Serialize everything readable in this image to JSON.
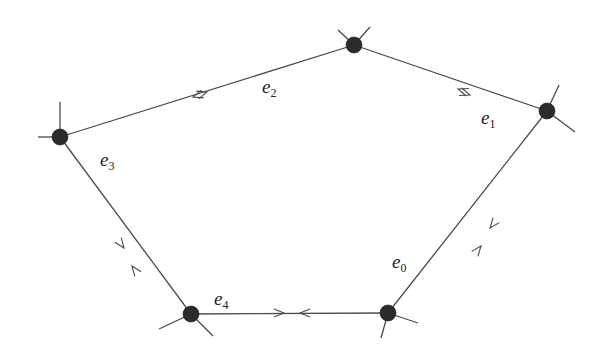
{
  "diagram": {
    "type": "pentagon-graph-with-directed-edge-pairs",
    "vertices": [
      {
        "id": "v_top",
        "x": 354,
        "y": 45,
        "stubs": [
          [
            -16,
            -15
          ],
          [
            16,
            -18
          ]
        ]
      },
      {
        "id": "v_right",
        "x": 547,
        "y": 111,
        "stubs": [
          [
            12,
            -26
          ],
          [
            28,
            21
          ]
        ]
      },
      {
        "id": "v_br",
        "x": 388,
        "y": 313,
        "stubs": [
          [
            30,
            10
          ],
          [
            -7,
            25
          ]
        ]
      },
      {
        "id": "v_bl",
        "x": 191,
        "y": 314,
        "stubs": [
          [
            -32,
            15
          ],
          [
            22,
            22
          ]
        ]
      },
      {
        "id": "v_left",
        "x": 60,
        "y": 137,
        "stubs": [
          [
            0,
            -35
          ],
          [
            -22,
            0
          ]
        ]
      }
    ],
    "edges": [
      {
        "name": "e0",
        "from": "v_br",
        "to": "v_right",
        "label_x": 392,
        "label_y": 268,
        "arrows": [
          {
            "x": 481,
            "y": 246,
            "dir": "to"
          },
          {
            "x": 490,
            "y": 228,
            "dir": "from"
          }
        ]
      },
      {
        "name": "e1",
        "from": "v_right",
        "to": "v_top",
        "label_x": 481,
        "label_y": 124,
        "arrows": [
          {
            "x": 458,
            "y": 89,
            "dir": "to"
          },
          {
            "x": 470,
            "y": 95,
            "dir": "from"
          }
        ]
      },
      {
        "name": "e2",
        "from": "v_top",
        "to": "v_left",
        "label_x": 262,
        "label_y": 93,
        "arrows": [
          {
            "x": 193,
            "y": 97,
            "dir": "to"
          },
          {
            "x": 207,
            "y": 92,
            "dir": "from"
          }
        ]
      },
      {
        "name": "e3",
        "from": "v_left",
        "to": "v_bl",
        "label_x": 100,
        "label_y": 166,
        "arrows": [
          {
            "x": 124,
            "y": 248,
            "dir": "to"
          },
          {
            "x": 132,
            "y": 266,
            "dir": "from"
          }
        ]
      },
      {
        "name": "e4",
        "from": "v_bl",
        "to": "v_br",
        "label_x": 214,
        "label_y": 305,
        "arrows": [
          {
            "x": 284,
            "y": 313,
            "dir": "to"
          },
          {
            "x": 300,
            "y": 313,
            "dir": "from"
          }
        ]
      }
    ],
    "labels": {
      "e0": {
        "base": "e",
        "sub": "0"
      },
      "e1": {
        "base": "e",
        "sub": "1"
      },
      "e2": {
        "base": "e",
        "sub": "2"
      },
      "e3": {
        "base": "e",
        "sub": "3"
      },
      "e4": {
        "base": "e",
        "sub": "4"
      }
    },
    "colors": {
      "line": "#4a4a4a",
      "vertex": "#2b2b2b",
      "background": "#ffffff"
    }
  }
}
